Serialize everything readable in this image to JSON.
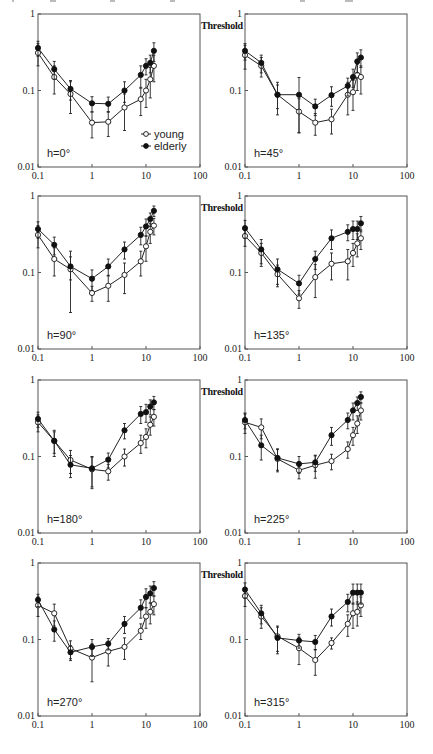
{
  "figure": {
    "ylabel": "Threshold",
    "legend": [
      {
        "name": "young",
        "marker": "open-circle"
      },
      {
        "name": "elderly",
        "marker": "filled-circle"
      }
    ],
    "x_ticks": [
      "0.1",
      "1",
      "10",
      "100"
    ],
    "y_ticks": [
      "0.01",
      "0.1",
      "1"
    ]
  },
  "chart_data": [
    {
      "type": "line",
      "title": "h=0°",
      "xscale": "log",
      "yscale": "log",
      "xlim": [
        0.1,
        100
      ],
      "ylim": [
        0.01,
        1
      ],
      "xlabel": "",
      "ylabel": "Threshold",
      "x": [
        0.1,
        0.2,
        0.4,
        1,
        2,
        4,
        8,
        10,
        12,
        14
      ],
      "legend_position": "lower right",
      "series": [
        {
          "name": "young",
          "values": [
            0.31,
            0.15,
            0.09,
            0.038,
            0.039,
            0.06,
            0.077,
            0.1,
            0.14,
            0.21
          ],
          "errors": [
            0.1,
            0.06,
            0.04,
            0.014,
            0.014,
            0.03,
            0.03,
            0.04,
            0.06,
            0.08
          ]
        },
        {
          "name": "elderly",
          "values": [
            0.36,
            0.19,
            0.105,
            0.068,
            0.067,
            0.1,
            0.16,
            0.21,
            0.23,
            0.33
          ],
          "errors": [
            0.08,
            0.05,
            0.03,
            0.015,
            0.015,
            0.03,
            0.05,
            0.05,
            0.06,
            0.09
          ]
        }
      ]
    },
    {
      "type": "line",
      "title": "h=45°",
      "xscale": "log",
      "yscale": "log",
      "xlim": [
        0.1,
        100
      ],
      "ylim": [
        0.01,
        1
      ],
      "xlabel": "",
      "ylabel": "Threshold",
      "x": [
        0.1,
        0.2,
        0.4,
        1,
        2,
        4,
        8,
        10,
        12,
        14
      ],
      "series": [
        {
          "name": "young",
          "values": [
            0.29,
            0.21,
            0.088,
            0.053,
            0.038,
            0.042,
            0.088,
            0.095,
            0.16,
            0.15
          ],
          "errors": [
            0.1,
            0.06,
            0.03,
            0.025,
            0.012,
            0.015,
            0.04,
            0.04,
            0.06,
            0.06
          ]
        },
        {
          "name": "elderly",
          "values": [
            0.33,
            0.23,
            0.088,
            0.088,
            0.062,
            0.087,
            0.115,
            0.15,
            0.24,
            0.27
          ],
          "errors": [
            0.08,
            0.06,
            0.04,
            0.06,
            0.015,
            0.025,
            0.03,
            0.04,
            0.07,
            0.07
          ]
        }
      ]
    },
    {
      "type": "line",
      "title": "h=90°",
      "xscale": "log",
      "yscale": "log",
      "xlim": [
        0.1,
        100
      ],
      "ylim": [
        0.01,
        1
      ],
      "xlabel": "",
      "ylabel": "Threshold",
      "x": [
        0.1,
        0.2,
        0.4,
        1,
        2,
        4,
        8,
        10,
        12,
        14
      ],
      "series": [
        {
          "name": "young",
          "values": [
            0.31,
            0.15,
            0.11,
            0.054,
            0.067,
            0.093,
            0.14,
            0.22,
            0.34,
            0.41
          ],
          "errors": [
            0.1,
            0.06,
            0.08,
            0.012,
            0.025,
            0.04,
            0.05,
            0.08,
            0.1,
            0.1
          ]
        },
        {
          "name": "elderly",
          "values": [
            0.37,
            0.23,
            0.12,
            0.083,
            0.12,
            0.2,
            0.31,
            0.4,
            0.5,
            0.64
          ],
          "errors": [
            0.09,
            0.06,
            0.04,
            0.025,
            0.03,
            0.05,
            0.08,
            0.1,
            0.1,
            0.1
          ]
        }
      ]
    },
    {
      "type": "line",
      "title": "h=135°",
      "xscale": "log",
      "yscale": "log",
      "xlim": [
        0.1,
        100
      ],
      "ylim": [
        0.01,
        1
      ],
      "xlabel": "",
      "ylabel": "Threshold",
      "x": [
        0.1,
        0.2,
        0.4,
        1,
        2,
        4,
        8,
        10,
        12,
        14
      ],
      "series": [
        {
          "name": "young",
          "values": [
            0.3,
            0.18,
            0.095,
            0.046,
            0.087,
            0.13,
            0.14,
            0.18,
            0.24,
            0.28
          ],
          "errors": [
            0.08,
            0.06,
            0.03,
            0.012,
            0.04,
            0.05,
            0.06,
            0.06,
            0.08,
            0.08
          ]
        },
        {
          "name": "elderly",
          "values": [
            0.38,
            0.2,
            0.11,
            0.072,
            0.15,
            0.28,
            0.34,
            0.37,
            0.37,
            0.44
          ],
          "errors": [
            0.1,
            0.07,
            0.04,
            0.02,
            0.04,
            0.08,
            0.08,
            0.1,
            0.1,
            0.1
          ]
        }
      ]
    },
    {
      "type": "line",
      "title": "h=180°",
      "xscale": "log",
      "yscale": "log",
      "xlim": [
        0.1,
        100
      ],
      "ylim": [
        0.01,
        1
      ],
      "xlabel": "",
      "ylabel": "Threshold",
      "x": [
        0.1,
        0.2,
        0.4,
        1,
        2,
        4,
        8,
        10,
        12,
        14
      ],
      "series": [
        {
          "name": "young",
          "values": [
            0.28,
            0.16,
            0.09,
            0.068,
            0.064,
            0.1,
            0.15,
            0.18,
            0.26,
            0.33
          ],
          "errors": [
            0.07,
            0.05,
            0.03,
            0.03,
            0.015,
            0.025,
            0.04,
            0.05,
            0.07,
            0.08
          ]
        },
        {
          "name": "elderly",
          "values": [
            0.31,
            0.16,
            0.078,
            0.07,
            0.091,
            0.22,
            0.36,
            0.38,
            0.45,
            0.51
          ],
          "errors": [
            0.07,
            0.06,
            0.025,
            0.03,
            0.02,
            0.05,
            0.09,
            0.1,
            0.1,
            0.1
          ]
        }
      ]
    },
    {
      "type": "line",
      "title": "h=225°",
      "xscale": "log",
      "yscale": "log",
      "xlim": [
        0.1,
        100
      ],
      "ylim": [
        0.01,
        1
      ],
      "xlabel": "",
      "ylabel": "Threshold",
      "x": [
        0.1,
        0.2,
        0.4,
        1,
        2,
        4,
        8,
        10,
        12,
        14
      ],
      "series": [
        {
          "name": "young",
          "values": [
            0.28,
            0.24,
            0.093,
            0.066,
            0.077,
            0.087,
            0.125,
            0.19,
            0.27,
            0.4
          ],
          "errors": [
            0.08,
            0.07,
            0.03,
            0.015,
            0.025,
            0.02,
            0.03,
            0.05,
            0.07,
            0.1
          ]
        },
        {
          "name": "elderly",
          "values": [
            0.3,
            0.14,
            0.096,
            0.08,
            0.084,
            0.19,
            0.3,
            0.4,
            0.5,
            0.6
          ],
          "errors": [
            0.07,
            0.05,
            0.03,
            0.02,
            0.02,
            0.05,
            0.07,
            0.1,
            0.1,
            0.1
          ]
        }
      ]
    },
    {
      "type": "line",
      "title": "h=270°",
      "xscale": "log",
      "yscale": "log",
      "xlim": [
        0.1,
        100
      ],
      "ylim": [
        0.01,
        1
      ],
      "xlabel": "",
      "ylabel": "Threshold",
      "x": [
        0.1,
        0.2,
        0.4,
        1,
        2,
        4,
        8,
        10,
        12,
        14
      ],
      "series": [
        {
          "name": "young",
          "values": [
            0.28,
            0.22,
            0.076,
            0.058,
            0.07,
            0.08,
            0.13,
            0.2,
            0.23,
            0.29
          ],
          "errors": [
            0.08,
            0.07,
            0.02,
            0.03,
            0.025,
            0.025,
            0.03,
            0.06,
            0.07,
            0.08
          ]
        },
        {
          "name": "elderly",
          "values": [
            0.33,
            0.135,
            0.068,
            0.08,
            0.088,
            0.16,
            0.26,
            0.36,
            0.4,
            0.47
          ],
          "errors": [
            0.06,
            0.04,
            0.015,
            0.02,
            0.015,
            0.04,
            0.07,
            0.1,
            0.1,
            0.1
          ]
        }
      ]
    },
    {
      "type": "line",
      "title": "h=315°",
      "xscale": "log",
      "yscale": "log",
      "xlim": [
        0.1,
        100
      ],
      "ylim": [
        0.01,
        1
      ],
      "xlabel": "",
      "ylabel": "Threshold",
      "x": [
        0.1,
        0.2,
        0.4,
        1,
        2,
        4,
        8,
        10,
        12,
        14
      ],
      "series": [
        {
          "name": "young",
          "values": [
            0.37,
            0.2,
            0.11,
            0.077,
            0.054,
            0.09,
            0.16,
            0.22,
            0.23,
            0.28
          ],
          "errors": [
            0.1,
            0.06,
            0.04,
            0.03,
            0.02,
            0.015,
            0.05,
            0.08,
            0.08,
            0.08
          ]
        },
        {
          "name": "elderly",
          "values": [
            0.45,
            0.22,
            0.105,
            0.097,
            0.093,
            0.2,
            0.31,
            0.41,
            0.41,
            0.41
          ],
          "errors": [
            0.1,
            0.06,
            0.04,
            0.02,
            0.02,
            0.05,
            0.08,
            0.12,
            0.12,
            0.12
          ]
        }
      ]
    }
  ]
}
